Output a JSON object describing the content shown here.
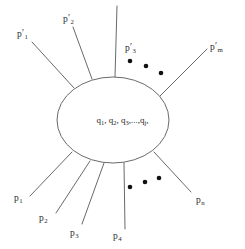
{
  "figure": {
    "type": "feynman-blob-diagram",
    "blob": {
      "shape": "ellipse",
      "center_x": 113,
      "center_y": 120,
      "radius_x": 56,
      "radius_y": 43,
      "contents_text": "q1, q2, q3,..., qj,",
      "contents_parts": [
        {
          "base": "q",
          "sub": "1"
        },
        {
          "base": "q",
          "sub": "2"
        },
        {
          "base": "q",
          "sub": "3"
        },
        {
          "base": "q",
          "sub": "j"
        }
      ],
      "separator": ",",
      "ellipsis": ",...,"
    },
    "outgoing_legs": [
      {
        "label_base": "p",
        "prime": "′",
        "sub": "1",
        "name": "p-prime-1",
        "label_x": 17,
        "label_y": 29,
        "x1": 32,
        "y1": 42,
        "x2": 74,
        "y2": 88
      },
      {
        "label_base": "p",
        "prime": "′",
        "sub": "2",
        "name": "p-prime-2",
        "label_x": 63,
        "label_y": 14,
        "x1": 73,
        "y1": 27,
        "x2": 92,
        "y2": 79
      },
      {
        "label_base": "p",
        "prime": "′",
        "sub": "3",
        "name": "p-prime-3",
        "label_x": 125,
        "label_y": 43,
        "x1": 117,
        "y1": 6,
        "x2": 115,
        "y2": 77
      },
      {
        "label_base": "p",
        "prime": "′",
        "sub": "m",
        "name": "p-prime-m",
        "label_x": 210,
        "label_y": 42,
        "x1": 207,
        "y1": 49,
        "x2": 160,
        "y2": 96
      }
    ],
    "incoming_legs": [
      {
        "label_base": "p",
        "prime": "",
        "sub": "1",
        "name": "p-1",
        "label_x": 14,
        "label_y": 194,
        "x1": 30,
        "y1": 196,
        "x2": 72,
        "y2": 152
      },
      {
        "label_base": "p",
        "prime": "",
        "sub": "2",
        "name": "p-2",
        "label_x": 39,
        "label_y": 214,
        "x1": 56,
        "y1": 213,
        "x2": 90,
        "y2": 161
      },
      {
        "label_base": "p",
        "prime": "",
        "sub": "3",
        "name": "p-3",
        "label_x": 70,
        "label_y": 229,
        "x1": 82,
        "y1": 224,
        "x2": 104,
        "y2": 163
      },
      {
        "label_base": "p",
        "prime": "",
        "sub": "4",
        "name": "p-4",
        "label_x": 113,
        "label_y": 232,
        "x1": 125,
        "y1": 229,
        "x2": 124,
        "y2": 163
      },
      {
        "label_base": "p",
        "prime": "",
        "sub": "n",
        "name": "p-n",
        "label_x": 196,
        "label_y": 196,
        "x1": 191,
        "y1": 192,
        "x2": 154,
        "y2": 152
      }
    ],
    "ellipsis_groups": [
      {
        "name": "top-ellipsis-dots",
        "dots": [
          {
            "cx": 130,
            "cy": 61,
            "r": 2.3
          },
          {
            "cx": 146,
            "cy": 66,
            "r": 2.3
          },
          {
            "cx": 161,
            "cy": 73,
            "r": 2.3
          }
        ]
      },
      {
        "name": "bottom-ellipsis-dots",
        "dots": [
          {
            "cx": 130,
            "cy": 187,
            "r": 2.3
          },
          {
            "cx": 145,
            "cy": 182,
            "r": 2.3
          },
          {
            "cx": 159,
            "cy": 178,
            "r": 2.3
          }
        ]
      }
    ],
    "colors": {
      "background": "#ffffff",
      "stroke": "#58585a",
      "text": "#2b2b2b",
      "dot": "#111111"
    }
  }
}
